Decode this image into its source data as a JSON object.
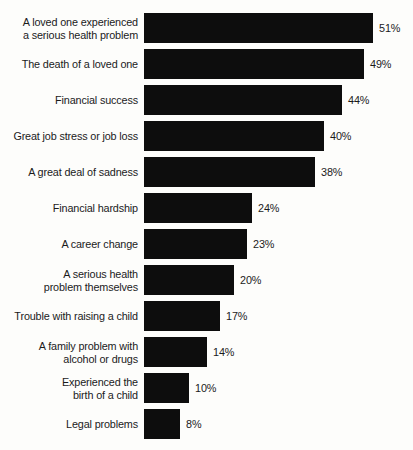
{
  "chart_data": {
    "type": "bar",
    "orientation": "horizontal",
    "title": "",
    "subtitle": "",
    "xlabel": "",
    "ylabel": "",
    "xlim": [
      0,
      51
    ],
    "grid": false,
    "legend": false,
    "value_suffix": "%",
    "categories": [
      "A loved one experienced\na serious health problem",
      "The death of a loved one",
      "Financial success",
      "Great job stress or job loss",
      "A great deal of sadness",
      "Financial hardship",
      "A career change",
      "A serious health\nproblem themselves",
      "Trouble with raising a child",
      "A family problem with\nalcohol or drugs",
      "Experienced the\nbirth of a child",
      "Legal problems"
    ],
    "values": [
      51,
      49,
      44,
      40,
      38,
      24,
      23,
      20,
      17,
      14,
      10,
      8
    ],
    "value_labels": [
      "51%",
      "49%",
      "44%",
      "40%",
      "38%",
      "24%",
      "23%",
      "20%",
      "17%",
      "14%",
      "10%",
      "8%"
    ],
    "bar_color": "#0d0d0d",
    "background_color": "#fdfdfb",
    "text_color": "#1b1b1b"
  }
}
